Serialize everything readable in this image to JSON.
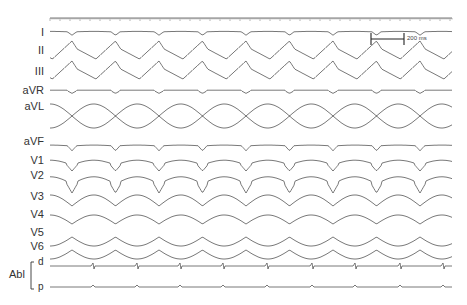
{
  "chart_data": {
    "type": "line",
    "title": "",
    "time_axis": {
      "ruler": true,
      "grid": false
    },
    "scale_bar": {
      "label": "200 ms"
    },
    "cycle_length_px": 43.5,
    "beats_visible": 9,
    "leads": [
      {
        "name": "I",
        "y": 32,
        "amp": 4,
        "shape": "notch"
      },
      {
        "name": "II",
        "y": 50,
        "amp": 18,
        "shape": "peak"
      },
      {
        "name": "III",
        "y": 70,
        "amp": 18,
        "shape": "peak"
      },
      {
        "name": "aVR",
        "y": 91,
        "amp": 4,
        "shape": "dip"
      },
      {
        "name": "aVL",
        "y": 116,
        "amp": 12,
        "shape": "crossing"
      },
      {
        "name": "aVF",
        "y": 146,
        "amp": 6,
        "shape": "notch"
      },
      {
        "name": "V1",
        "y": 165,
        "amp": 12,
        "shape": "deepdip"
      },
      {
        "name": "V2",
        "y": 184,
        "amp": 18,
        "shape": "deepdip"
      },
      {
        "name": "V3",
        "y": 206,
        "amp": 22,
        "shape": "wide"
      },
      {
        "name": "V4",
        "y": 224,
        "amp": 18,
        "shape": "wide"
      },
      {
        "name": "V5",
        "y": 237,
        "amp": 18,
        "shape": "wideinv"
      },
      {
        "name": "V6",
        "y": 250,
        "amp": 18,
        "shape": "wideinv"
      }
    ],
    "ablation": {
      "label": "Abl",
      "channels": [
        {
          "name": "d",
          "y": 266,
          "amp": 6,
          "shape": "spike"
        },
        {
          "name": "p",
          "y": 287,
          "amp": 2,
          "shape": "bump"
        }
      ],
      "spike_x": [
        44,
        93,
        137,
        180,
        223,
        267,
        312,
        355,
        400,
        443
      ]
    }
  },
  "labels": {
    "I": "I",
    "II": "II",
    "III": "III",
    "aVR": "aVR",
    "aVL": "aVL",
    "aVF": "aVF",
    "V1": "V1",
    "V2": "V2",
    "V3": "V3",
    "V4": "V4",
    "V5": "V5",
    "V6": "V6",
    "abl": "Abl",
    "d": "d",
    "p": "p",
    "scale": "200 ms"
  }
}
